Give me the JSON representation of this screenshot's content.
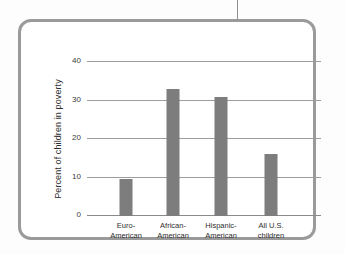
{
  "chart_data": {
    "type": "bar",
    "title": "",
    "xlabel": "",
    "ylabel": "Percent of children in poverty",
    "ylim": [
      0,
      40
    ],
    "yticks": [
      0,
      10,
      20,
      30,
      40
    ],
    "ytick_labels": [
      "0",
      "10",
      "20",
      "30",
      "40"
    ],
    "grid": true,
    "legend": false,
    "categories": [
      "Euro-American",
      "African-American",
      "Hispanic-American",
      "All U.S. children"
    ],
    "category_lines": [
      [
        "Euro-",
        "American"
      ],
      [
        "African-",
        "American"
      ],
      [
        "Hispanic-",
        "American"
      ],
      [
        "All U.S.",
        "children"
      ]
    ],
    "values": [
      9.5,
      33,
      30.8,
      16
    ],
    "bar_color": "#7d7d7d",
    "axis_color": "#9d9d9d"
  },
  "frame": {
    "border_color": "#9a9a9a",
    "background": "#ffffff"
  }
}
